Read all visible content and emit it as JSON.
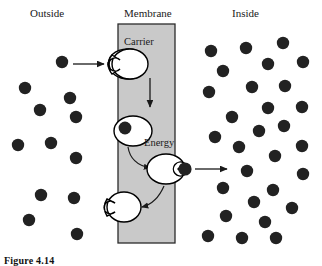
{
  "figure": {
    "caption": "Figure 4.14",
    "title_outside": "Outside",
    "title_membrane": "Membrane",
    "title_inside": "Inside",
    "carrier_label": "Carrier",
    "energy_label": "Energy",
    "colors": {
      "membrane_fill": "#c9c9c9",
      "membrane_stroke": "#2b2b2b",
      "particle": "#222222",
      "carrier_fill": "#ffffff",
      "carrier_stroke": "#000000",
      "arrow": "#1a1a1a",
      "background": "#ffffff"
    }
  },
  "diagram": {
    "type": "membrane-transport",
    "membrane": {
      "x": 118,
      "y": 24,
      "width": 57,
      "height": 219
    },
    "particles_outside": [
      {
        "cx": 62,
        "cy": 62,
        "r": 6.2
      },
      {
        "cx": 25,
        "cy": 88,
        "r": 6.2
      },
      {
        "cx": 70,
        "cy": 98,
        "r": 6.2
      },
      {
        "cx": 40,
        "cy": 110,
        "r": 6.2
      },
      {
        "cx": 76,
        "cy": 117,
        "r": 6.2
      },
      {
        "cx": 18,
        "cy": 145,
        "r": 6.2
      },
      {
        "cx": 51,
        "cy": 143,
        "r": 6.2
      },
      {
        "cx": 76,
        "cy": 158,
        "r": 6.2
      },
      {
        "cx": 41,
        "cy": 195,
        "r": 6.2
      },
      {
        "cx": 74,
        "cy": 198,
        "r": 6.2
      },
      {
        "cx": 29,
        "cy": 220,
        "r": 6.2
      },
      {
        "cx": 77,
        "cy": 234,
        "r": 6.2
      }
    ],
    "particles_inside": [
      {
        "cx": 211,
        "cy": 51,
        "r": 6.2
      },
      {
        "cx": 246,
        "cy": 48,
        "r": 6.2
      },
      {
        "cx": 283,
        "cy": 43,
        "r": 6.2
      },
      {
        "cx": 268,
        "cy": 64,
        "r": 6.2
      },
      {
        "cx": 303,
        "cy": 62,
        "r": 6.2
      },
      {
        "cx": 223,
        "cy": 71,
        "r": 6.2
      },
      {
        "cx": 252,
        "cy": 87,
        "r": 6.2
      },
      {
        "cx": 285,
        "cy": 86,
        "r": 6.2
      },
      {
        "cx": 209,
        "cy": 92,
        "r": 6.2
      },
      {
        "cx": 268,
        "cy": 108,
        "r": 6.2
      },
      {
        "cx": 302,
        "cy": 107,
        "r": 6.2
      },
      {
        "cx": 232,
        "cy": 117,
        "r": 6.2
      },
      {
        "cx": 259,
        "cy": 131,
        "r": 6.2
      },
      {
        "cx": 284,
        "cy": 126,
        "r": 6.2
      },
      {
        "cx": 215,
        "cy": 137,
        "r": 6.2
      },
      {
        "cx": 239,
        "cy": 147,
        "r": 6.2
      },
      {
        "cx": 302,
        "cy": 146,
        "r": 6.2
      },
      {
        "cx": 275,
        "cy": 156,
        "r": 6.2
      },
      {
        "cx": 247,
        "cy": 171,
        "r": 6.2
      },
      {
        "cx": 303,
        "cy": 174,
        "r": 6.2
      },
      {
        "cx": 223,
        "cy": 188,
        "r": 6.2
      },
      {
        "cx": 273,
        "cy": 190,
        "r": 6.2
      },
      {
        "cx": 254,
        "cy": 202,
        "r": 6.2
      },
      {
        "cx": 292,
        "cy": 208,
        "r": 6.2
      },
      {
        "cx": 226,
        "cy": 216,
        "r": 6.2
      },
      {
        "cx": 265,
        "cy": 222,
        "r": 6.2
      },
      {
        "cx": 208,
        "cy": 236,
        "r": 6.2
      },
      {
        "cx": 242,
        "cy": 238,
        "r": 6.2
      },
      {
        "cx": 276,
        "cy": 238,
        "r": 6.2
      }
    ],
    "bound_particles": [
      {
        "cx": 125,
        "cy": 129,
        "r": 6.4,
        "state": "bound-at-top-carrier"
      },
      {
        "cx": 183,
        "cy": 168,
        "r": 6.6,
        "state": "releasing-at-inside"
      }
    ],
    "carriers": [
      {
        "id": "carrier-empty-top",
        "cx": 128,
        "cy": 64,
        "rx": 19,
        "ry": 15,
        "notch": "left",
        "state": "empty-awaiting-solute"
      },
      {
        "id": "carrier-loaded",
        "cx": 133,
        "cy": 131,
        "rx": 19,
        "ry": 15,
        "notch": "left-filled",
        "state": "solute-bound"
      },
      {
        "id": "carrier-releasing",
        "cx": 166,
        "cy": 169,
        "rx": 19,
        "ry": 15,
        "notch": "right",
        "state": "releasing-solute"
      },
      {
        "id": "carrier-returning",
        "cx": 124,
        "cy": 207,
        "rx": 17,
        "ry": 15,
        "notch": "left",
        "state": "empty-recycling"
      }
    ],
    "arrows": [
      {
        "id": "arrow-influx",
        "type": "straight",
        "x1": 73,
        "y1": 64,
        "x2": 106,
        "y2": 64,
        "direction": "right"
      },
      {
        "id": "arrow-translocation",
        "type": "straight",
        "x1": 150,
        "y1": 79,
        "x2": 150,
        "y2": 108,
        "direction": "down"
      },
      {
        "id": "arrow-energy-step",
        "type": "curved",
        "direction": "down-right"
      },
      {
        "id": "arrow-efflux",
        "type": "straight",
        "x1": 196,
        "y1": 168,
        "x2": 228,
        "y2": 168,
        "direction": "right"
      },
      {
        "id": "arrow-recycle",
        "type": "curved",
        "direction": "down-left"
      }
    ]
  }
}
